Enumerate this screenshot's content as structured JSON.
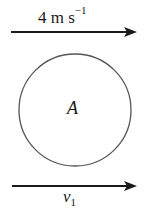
{
  "diagram": {
    "top_arrow": {
      "label_value": "4 m s",
      "label_exponent": "−1",
      "direction": "right"
    },
    "circle": {
      "label": "A"
    },
    "bottom_arrow": {
      "label_symbol": "v",
      "label_subscript": "1",
      "direction": "right"
    },
    "colors": {
      "stroke": "#1a1a1a",
      "circle_stroke": "#555555",
      "background": "#ffffff"
    }
  }
}
